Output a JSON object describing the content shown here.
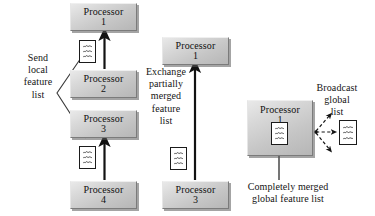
{
  "figure": {
    "kind": "parallel-feature-merge-diagram",
    "background_color": "#ffffff",
    "box_fill_color": "#cfcfcf",
    "box_border_color": "#7b7b7b",
    "ink_color": "#141414"
  },
  "processors": [
    {
      "id": "p1-top",
      "name": "Processor",
      "number": "1"
    },
    {
      "id": "p2",
      "name": "Processor",
      "number": "2"
    },
    {
      "id": "p3",
      "name": "Processor",
      "number": "3"
    },
    {
      "id": "p4",
      "name": "Processor",
      "number": "4"
    },
    {
      "id": "p1-middle",
      "name": "Processor",
      "number": "1"
    },
    {
      "id": "p3-middle",
      "name": "Processor",
      "number": "3"
    },
    {
      "id": "p1-right",
      "name": "Processor",
      "number": "1"
    }
  ],
  "captions": {
    "send_local": "Send\nlocal\nfeature\nlist",
    "exchange_partial": "Exchange\npartially\nmerged\nfeature\nlist",
    "broadcast_global": "Broadcast\nglobal\nlist",
    "completely_merged": "Completely merged\nglobal feature list"
  },
  "feature_lists": {
    "label": "feature list sheet",
    "row_count": 3,
    "instances": [
      "local-list-p2",
      "local-list-p4",
      "partial-list-p3",
      "global-list-inside-p1",
      "broadcast-list"
    ]
  },
  "arrows": {
    "solid_count": 3,
    "dashed_count": 3,
    "leader_lines": 2
  }
}
